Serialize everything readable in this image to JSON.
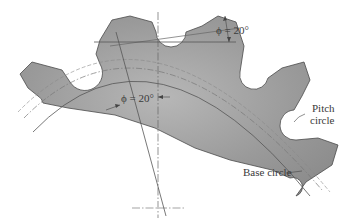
{
  "figure": {
    "labels": {
      "pressure_angle_top": "ϕ = 20°",
      "pressure_angle_mid": "ϕ = 20°",
      "pitch_circle_line1": "Pitch",
      "pitch_circle_line2": "circle",
      "base_circle": "Base circle"
    },
    "colors": {
      "gear_fill": "#8f8f8f",
      "gear_fill_light": "#b4b4b4",
      "outline": "#4a4a4a",
      "construction_line": "#6a6a6a",
      "background": "#ffffff"
    },
    "parameters": {
      "pressure_angle_deg": 20,
      "visible_teeth": 5
    }
  }
}
